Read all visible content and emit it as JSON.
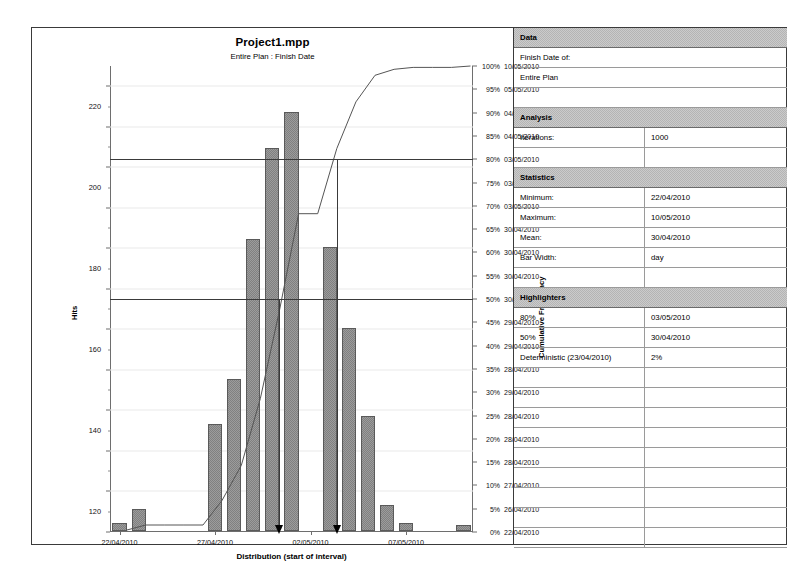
{
  "chart": {
    "title": "Project1.mpp",
    "subtitle": "Entire Plan : Finish Date",
    "x_axis_title": "Distribution (start of interval)",
    "y_axis_title": "Hits",
    "y2_axis_title": "Cumulative Frequency"
  },
  "chart_data": {
    "type": "bar",
    "title": "Project1.mpp",
    "subtitle": "Entire Plan : Finish Date",
    "xlabel": "Distribution (start of interval)",
    "ylabel": "Hits",
    "y2label": "Cumulative Frequency",
    "ylim": [
      0,
      230
    ],
    "ytick_values": [
      0,
      20,
      40,
      60,
      80,
      100,
      120,
      140,
      160,
      180,
      200,
      220
    ],
    "xtick_labels": [
      "22/04/2010",
      "27/04/2010",
      "02/05/2010",
      "07/05/2010"
    ],
    "xtick_positions": [
      0,
      5,
      10,
      15
    ],
    "grid": true,
    "bar_width": "day",
    "categories": [
      "22/04/2010",
      "23/04/2010",
      "24/04/2010",
      "25/04/2010",
      "26/04/2010",
      "27/04/2010",
      "28/04/2010",
      "29/04/2010",
      "30/04/2010",
      "01/05/2010",
      "02/05/2010",
      "03/05/2010",
      "04/05/2010",
      "05/05/2010",
      "06/05/2010",
      "07/05/2010",
      "08/05/2010",
      "09/05/2010",
      "10/05/2010"
    ],
    "values": [
      4,
      11,
      0,
      0,
      0,
      53,
      75,
      144,
      189,
      207,
      0,
      140,
      100,
      57,
      13,
      4,
      0,
      0,
      3
    ],
    "series": [
      {
        "name": "Hits",
        "type": "bar",
        "values": [
          4,
          11,
          0,
          0,
          0,
          53,
          75,
          144,
          189,
          207,
          0,
          140,
          100,
          57,
          13,
          4,
          0,
          0,
          3
        ]
      },
      {
        "name": "Cumulative Frequency",
        "type": "line",
        "axis": "right",
        "unit": "percent",
        "values": [
          0.4,
          1.5,
          1.5,
          1.5,
          1.5,
          6.8,
          14.3,
          28.7,
          47.6,
          68.3,
          68.3,
          82.3,
          92.3,
          98.0,
          99.3,
          99.7,
          99.7,
          99.7,
          100.0
        ]
      }
    ],
    "highlighters": [
      {
        "label": "80%",
        "level_percent": 80,
        "value": "03/05/2010"
      },
      {
        "label": "50%",
        "level_percent": 50,
        "value": "30/04/2010"
      }
    ],
    "markers": [
      {
        "label": "50% marker",
        "date": "30/04/2010"
      },
      {
        "label": "80% marker",
        "date": "03/05/2010"
      }
    ],
    "right_axis": [
      {
        "percent": "100%",
        "date": "10/05/2010"
      },
      {
        "percent": "95%",
        "date": "05/05/2010"
      },
      {
        "percent": "90%",
        "date": "04/05/2010"
      },
      {
        "percent": "85%",
        "date": "04/05/2010"
      },
      {
        "percent": "80%",
        "date": "03/05/2010"
      },
      {
        "percent": "75%",
        "date": "03/05/2010"
      },
      {
        "percent": "70%",
        "date": "03/05/2010"
      },
      {
        "percent": "65%",
        "date": "30/04/2010"
      },
      {
        "percent": "60%",
        "date": "30/04/2010"
      },
      {
        "percent": "55%",
        "date": "30/04/2010"
      },
      {
        "percent": "50%",
        "date": "30/04/2010"
      },
      {
        "percent": "45%",
        "date": "29/04/2010"
      },
      {
        "percent": "40%",
        "date": "29/04/2010"
      },
      {
        "percent": "35%",
        "date": "28/04/2010"
      },
      {
        "percent": "30%",
        "date": "29/04/2010"
      },
      {
        "percent": "25%",
        "date": "28/04/2010"
      },
      {
        "percent": "20%",
        "date": "28/04/2010"
      },
      {
        "percent": "15%",
        "date": "28/04/2010"
      },
      {
        "percent": "10%",
        "date": "27/04/2010"
      },
      {
        "percent": "5%",
        "date": "26/04/2010"
      },
      {
        "percent": "0%",
        "date": "22/04/2010"
      }
    ]
  },
  "table": {
    "sections": [
      {
        "header": "Data",
        "rows": [
          {
            "label": "Finish Date of:",
            "value": "",
            "full": true
          },
          {
            "label": "Entire Plan",
            "value": "",
            "full": true
          },
          {
            "label": "",
            "value": "",
            "full": true
          }
        ]
      },
      {
        "header": "Analysis",
        "rows": [
          {
            "label": "Iterations:",
            "value": "1000",
            "full": false
          },
          {
            "label": "",
            "value": "",
            "full": false
          }
        ]
      },
      {
        "header": "Statistics",
        "rows": [
          {
            "label": "Minimum:",
            "value": "22/04/2010",
            "full": false
          },
          {
            "label": "Maximum:",
            "value": "10/05/2010",
            "full": false
          },
          {
            "label": "Mean:",
            "value": "30/04/2010",
            "full": false
          },
          {
            "label": "Bar Width:",
            "value": "day",
            "full": false
          },
          {
            "label": "",
            "value": "",
            "full": false
          }
        ]
      },
      {
        "header": "Highlighters",
        "rows": [
          {
            "label": "80%",
            "value": "03/05/2010",
            "full": false
          },
          {
            "label": "50%",
            "value": "30/04/2010",
            "full": false
          },
          {
            "label": "Deterministic (23/04/2010)",
            "value": "2%",
            "full": false
          },
          {
            "label": "",
            "value": "",
            "full": false
          },
          {
            "label": "",
            "value": "",
            "full": false
          },
          {
            "label": "",
            "value": "",
            "full": false
          },
          {
            "label": "",
            "value": "",
            "full": false
          },
          {
            "label": "",
            "value": "",
            "full": false
          },
          {
            "label": "",
            "value": "",
            "full": false
          },
          {
            "label": "",
            "value": "",
            "full": false
          },
          {
            "label": "",
            "value": "",
            "full": false
          },
          {
            "label": "",
            "value": "",
            "full": false
          }
        ]
      }
    ]
  }
}
